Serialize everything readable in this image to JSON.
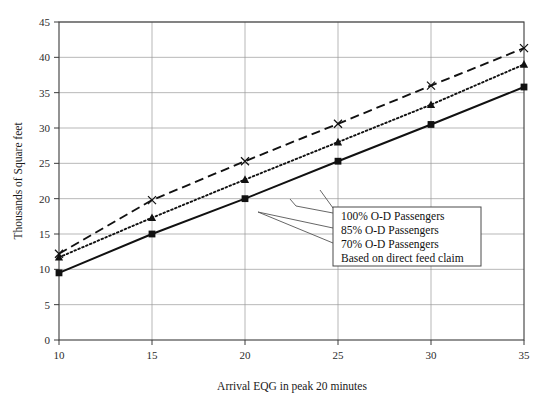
{
  "chart_data": {
    "type": "line",
    "title": "",
    "xlabel": "Arrival EQG in peak 20 minutes",
    "ylabel": "Thousands of Square feet",
    "xlim": [
      10,
      35
    ],
    "ylim": [
      0,
      45
    ],
    "xticks": [
      10,
      15,
      20,
      25,
      30,
      35
    ],
    "yticks": [
      0,
      5,
      10,
      15,
      20,
      25,
      30,
      35,
      40,
      45
    ],
    "grid": true,
    "legend_position": "inside-right",
    "x": [
      10,
      15,
      20,
      25,
      30,
      35
    ],
    "series": [
      {
        "name": "100% O-D Passengers",
        "style": "dashed",
        "marker": "x",
        "values": [
          12.2,
          19.8,
          25.3,
          30.6,
          36.0,
          41.3
        ]
      },
      {
        "name": "85% O-D Passengers",
        "style": "dotted",
        "marker": "triangle",
        "values": [
          11.7,
          17.3,
          22.7,
          28.0,
          33.3,
          39.0
        ]
      },
      {
        "name": "70% O-D Passengers",
        "style": "solid",
        "marker": "square",
        "values": [
          9.5,
          15.0,
          20.0,
          25.3,
          30.5,
          35.8
        ]
      }
    ],
    "annotations": [
      "100% O-D Passengers",
      "85% O-D Passengers",
      "70% O-D Passengers",
      "Based on direct feed claim"
    ]
  },
  "axes": {
    "y_title": "Thousands of Square feet",
    "x_title": "Arrival EQG in peak 20 minutes",
    "y_tick_labels": [
      "45",
      "40",
      "35",
      "30",
      "25",
      "20",
      "15",
      "10",
      "5",
      "0"
    ],
    "x_tick_labels": [
      "10",
      "15",
      "20",
      "25",
      "30",
      "35"
    ]
  },
  "legend": {
    "lines": [
      "100% O-D Passengers",
      "85% O-D Passengers",
      "70% O-D Passengers",
      "Based on direct feed claim"
    ]
  },
  "colors": {
    "line": "#111111",
    "grid": "#9a9a9a",
    "axis": "#3b3b3b",
    "background": "#ffffff",
    "legend_border": "#4a4a4a"
  }
}
